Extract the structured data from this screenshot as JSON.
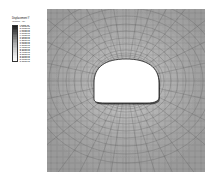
{
  "legend": {
    "title": "Displacement  Y",
    "subtitle": "(Tunnel - m)",
    "levels": [
      "4.375E-13",
      "-1.500E-03",
      "-3.000E-03",
      "-4.500E-03",
      "-6.000E-03",
      "-7.500E-03",
      "-9.000E-03",
      "-1.050E-02",
      "-1.200E-02",
      "-1.350E-02",
      "-1.500E-02",
      "-1.650E-02",
      "-1.800E-02",
      "-1.950E-02",
      "-2.100E-02",
      "-2.250E-02",
      "-2.400E-02",
      "-2.550E-02",
      "-2.700E-02",
      "-2.850E-02",
      "-3.000E-02",
      "-3.150E-02"
    ],
    "colors": [
      "#1c1c1c",
      "#2a2a2a",
      "#383838",
      "#464646",
      "#545454",
      "#626262",
      "#707070",
      "#7e7e7e",
      "#8b8b8b",
      "#989898",
      "#a3a3a3",
      "#aeaeae",
      "#b8b8b8",
      "#c2c2c2",
      "#cbcbcb",
      "#d3d3d3",
      "#dadada",
      "#e1e1e1",
      "#e8e8e8",
      "#efefef",
      "#f5f5f5",
      "#fbfbfb"
    ]
  },
  "plot": {
    "background": "#b0b0b0",
    "mesh_color": "#5a5a5a",
    "opening_fill": "#ffffff",
    "opening_outline": "#1a1a1a"
  },
  "chart_data": {
    "type": "heatmap",
    "title": "Displacement Y (Tunnel - m)",
    "xlabel": "",
    "ylabel": "",
    "legend_position": "left",
    "grid": true,
    "colorbar": {
      "min": -0.0315,
      "max": 4.375e-13,
      "step": -0.0015,
      "units": "m",
      "n_levels": 22,
      "tick_labels": [
        "4.375E-13",
        "-1.500E-03",
        "-3.000E-03",
        "-4.500E-03",
        "-6.000E-03",
        "-7.500E-03",
        "-9.000E-03",
        "-1.050E-02",
        "-1.200E-02",
        "-1.350E-02",
        "-1.500E-02",
        "-1.650E-02",
        "-1.800E-02",
        "-1.950E-02",
        "-2.100E-02",
        "-2.250E-02",
        "-2.400E-02",
        "-2.550E-02",
        "-2.700E-02",
        "-2.850E-02",
        "-3.000E-02",
        "-3.150E-02"
      ]
    },
    "values": [
      [
        -0.0015,
        -0.0018,
        -0.0022,
        -0.0026,
        -0.003,
        -0.0026,
        -0.0022,
        -0.0018,
        -0.0015
      ],
      [
        -0.0024,
        -0.0032,
        -0.0042,
        -0.0055,
        -0.0062,
        -0.0055,
        -0.0042,
        -0.0032,
        -0.0024
      ],
      [
        -0.0038,
        -0.0055,
        -0.0078,
        -0.011,
        -0.013,
        -0.011,
        -0.0078,
        -0.0055,
        -0.0038
      ],
      [
        -0.0055,
        -0.0085,
        -0.0135,
        -0.0215,
        -0.0265,
        -0.0215,
        -0.0135,
        -0.0085,
        -0.0055
      ],
      [
        -0.0062,
        -0.0098,
        -0.0165,
        -0.029,
        -0.0315,
        -0.029,
        -0.0165,
        -0.0098,
        -0.0062
      ],
      [
        -0.0055,
        -0.0085,
        -0.0138,
        -0.0225,
        -0.0275,
        -0.0225,
        -0.0138,
        -0.0085,
        -0.0055
      ],
      [
        -0.004,
        -0.0058,
        -0.0082,
        -0.0118,
        -0.014,
        -0.0118,
        -0.0082,
        -0.0058,
        -0.004
      ],
      [
        -0.0026,
        -0.0035,
        -0.0046,
        -0.006,
        -0.0068,
        -0.006,
        -0.0046,
        -0.0035,
        -0.0026
      ],
      [
        -0.0016,
        -0.002,
        -0.0025,
        -0.003,
        -0.0034,
        -0.003,
        -0.0025,
        -0.002,
        -0.0016
      ]
    ]
  }
}
